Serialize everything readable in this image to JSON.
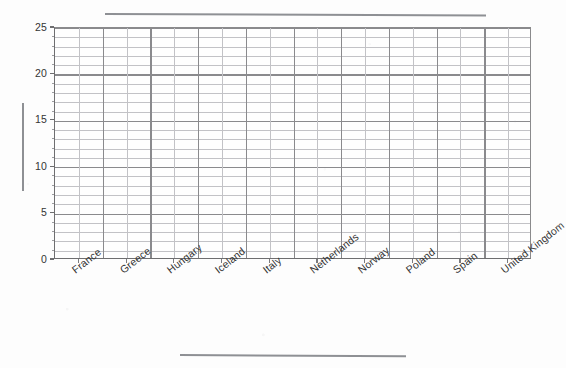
{
  "chart_data": {
    "type": "bar",
    "title": "",
    "subtitle": "",
    "xlabel": "",
    "ylabel": "",
    "categories": [
      "France",
      "Greece",
      "Hungary",
      "Iceland",
      "Italy",
      "Netherlands",
      "Norway",
      "Poland",
      "Spain",
      "United Kingdom"
    ],
    "values": [
      null,
      null,
      null,
      null,
      null,
      null,
      null,
      null,
      null,
      null
    ],
    "series": [],
    "ylim": [
      0,
      25
    ],
    "y_ticks": [
      0,
      5,
      10,
      15,
      20,
      25
    ],
    "y_tick_labels": [
      "0",
      "5",
      "10",
      "15",
      "20",
      "25"
    ],
    "y_minor_step": 1,
    "x_minor_divisions_per_category": 2,
    "grid": "both",
    "legend": "none",
    "annotations": [],
    "note": "Empty grid template: no data series plotted; title, x-axis title and y-axis title are redacted as solid bars."
  },
  "axes": {
    "y": {
      "ticks": [
        {
          "label": "25",
          "value": 25
        },
        {
          "label": "20",
          "value": 20
        },
        {
          "label": "15",
          "value": 15
        },
        {
          "label": "10",
          "value": 10
        },
        {
          "label": "5",
          "value": 5
        },
        {
          "label": "0",
          "value": 0
        }
      ],
      "min": 0,
      "max": 25
    },
    "x": {
      "ticks": [
        {
          "label": "France"
        },
        {
          "label": "Greece"
        },
        {
          "label": "Hungary"
        },
        {
          "label": "Iceland"
        },
        {
          "label": "Italy"
        },
        {
          "label": "Netherlands"
        },
        {
          "label": "Norway"
        },
        {
          "label": "Poland"
        },
        {
          "label": "Spain"
        },
        {
          "label": "United Kingdom"
        }
      ],
      "label_rotation_deg": -38
    }
  },
  "redactions": {
    "chart_title": "",
    "x_axis_title": "",
    "y_axis_title": ""
  },
  "colors": {
    "page_background": "#fdfdfd",
    "plot_background": "#fefefe",
    "gridline_minor": "#c2c2c6",
    "gridline_major": "#8a8a8d",
    "axis_line": "#6e6e70",
    "text": "#333333",
    "redaction_bar": "#8e9094"
  }
}
